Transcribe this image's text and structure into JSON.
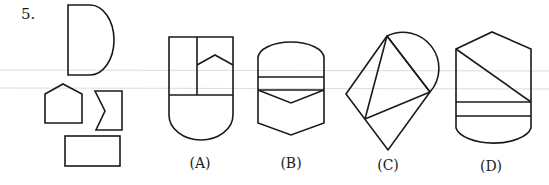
{
  "question": {
    "number": "5.",
    "prompt_pieces": [
      "half-disc (D shape)",
      "pentagon",
      "notched rectangle",
      "rectangle"
    ],
    "options": [
      {
        "key": "A",
        "label": "(A)"
      },
      {
        "key": "B",
        "label": "(B)"
      },
      {
        "key": "C",
        "label": "(C)"
      },
      {
        "key": "D",
        "label": "(D)"
      }
    ]
  },
  "colors": {
    "stroke": "#1a1a1a",
    "background": "#ffffff",
    "scan_line": "#dcdcdc"
  }
}
